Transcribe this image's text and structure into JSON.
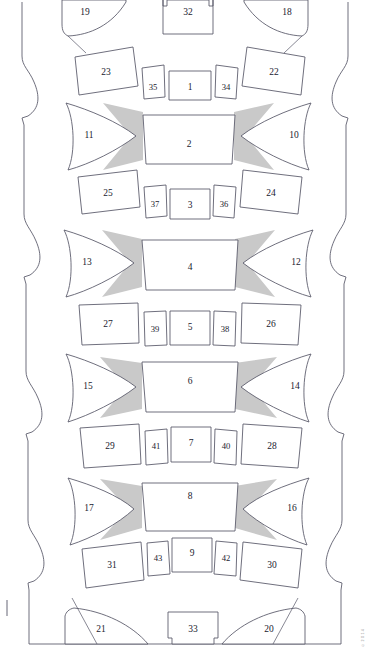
{
  "diagram": {
    "type": "line-diagram",
    "canvas": {
      "width": 367,
      "height": 655
    },
    "colors": {
      "stroke": "#555566",
      "fill": "#ffffff",
      "wing_gray": "#c9c9c9",
      "label_text": "#1a1a2e",
      "background": "#ffffff",
      "edge_note": "#8a8a8a"
    },
    "edge_note": "© 2 0 1 4",
    "outer_boundary": {
      "name": "scalloped-outline",
      "left_x": 18,
      "right_x": 352,
      "top_y": 2,
      "bottom_y": 644,
      "scallop_count": 4
    },
    "segments": [
      {
        "index": 1,
        "center_label": "1",
        "wing_left": "11",
        "wing_right": "10",
        "core_label": "2",
        "row_left_outer": "23",
        "row_left_inner": "35",
        "row_right_inner": "34",
        "row_right_outer": "22",
        "lower_left_outer": "25",
        "lower_left_inner": "37",
        "lower_center": "3",
        "lower_right_inner": "36",
        "lower_right_outer": "24"
      },
      {
        "index": 2,
        "wing_left": "13",
        "wing_right": "12",
        "core_label": "4",
        "lower_left_outer": "27",
        "lower_left_inner": "39",
        "lower_center": "5",
        "lower_right_inner": "38",
        "lower_right_outer": "26"
      },
      {
        "index": 3,
        "wing_left": "15",
        "wing_right": "14",
        "core_label": "6",
        "lower_left_outer": "29",
        "lower_left_inner": "41",
        "lower_center": "7",
        "lower_right_inner": "40",
        "lower_right_outer": "28"
      },
      {
        "index": 4,
        "wing_left": "17",
        "wing_right": "16",
        "core_label": "8",
        "lower_left_outer": "31",
        "lower_left_inner": "43",
        "lower_center": "9",
        "lower_right_inner": "42",
        "lower_right_outer": "30"
      }
    ],
    "top": {
      "arch_left": "19",
      "arch_right": "18",
      "center_block": "32"
    },
    "bottom": {
      "fin_left": "21",
      "fin_right": "20",
      "center_block": "33"
    },
    "labels": {
      "n1": "1",
      "n2": "2",
      "n3": "3",
      "n4": "4",
      "n5": "5",
      "n6": "6",
      "n7": "7",
      "n8": "8",
      "n9": "9",
      "n10": "10",
      "n11": "11",
      "n12": "12",
      "n13": "13",
      "n14": "14",
      "n15": "15",
      "n16": "16",
      "n17": "17",
      "n18": "18",
      "n19": "19",
      "n20": "20",
      "n21": "21",
      "n22": "22",
      "n23": "23",
      "n24": "24",
      "n25": "25",
      "n26": "26",
      "n27": "27",
      "n28": "28",
      "n29": "29",
      "n30": "30",
      "n31": "31",
      "n32": "32",
      "n33": "33",
      "n34": "34",
      "n35": "35",
      "n36": "36",
      "n37": "37",
      "n38": "38",
      "n39": "39",
      "n40": "40",
      "n41": "41",
      "n42": "42",
      "n43": "43"
    }
  }
}
